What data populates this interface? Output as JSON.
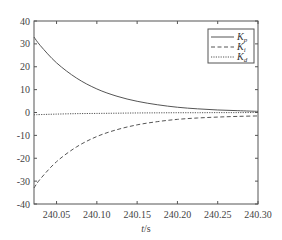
{
  "chart_data": {
    "type": "line",
    "title": "",
    "xlabel": "t/s",
    "ylabel": "",
    "xlim": [
      240.022,
      240.3
    ],
    "ylim": [
      -40,
      40
    ],
    "xticks": [
      240.05,
      240.1,
      240.15,
      240.2,
      240.25,
      240.3
    ],
    "xtick_labels": [
      "240.05",
      "240.10",
      "240.15",
      "240.20",
      "240.25",
      "240.30"
    ],
    "yticks": [
      40,
      30,
      20,
      10,
      0,
      -10,
      -20,
      -30,
      -40
    ],
    "ytick_labels": [
      "40",
      "30",
      "20",
      "10",
      "0",
      "-10",
      "-20",
      "-30",
      "-40"
    ],
    "grid": false,
    "legend_position": "upper right",
    "x": [
      240.022,
      240.03,
      240.05,
      240.075,
      240.1,
      240.125,
      240.15,
      240.175,
      240.2,
      240.225,
      240.25,
      240.275,
      240.3
    ],
    "series": [
      {
        "name": "Kp",
        "label_main": "K",
        "label_sub": "p",
        "style": "solid",
        "values": [
          33,
          29.2,
          21.7,
          15.0,
          10.3,
          7.1,
          4.9,
          3.4,
          2.3,
          1.6,
          1.1,
          0.8,
          0.5
        ]
      },
      {
        "name": "Ki",
        "label_main": "K",
        "label_sub": "i",
        "style": "dashed",
        "values": [
          -33,
          -29,
          -21.5,
          -15,
          -10.5,
          -7.5,
          -5.4,
          -4.0,
          -3.0,
          -2.4,
          -2.0,
          -1.7,
          -1.5
        ]
      },
      {
        "name": "Kd",
        "label_main": "K",
        "label_sub": "d",
        "style": "dotted",
        "values": [
          -1.0,
          -0.9,
          -0.7,
          -0.5,
          -0.4,
          -0.3,
          -0.2,
          -0.15,
          -0.1,
          -0.1,
          -0.05,
          -0.05,
          0
        ]
      }
    ]
  },
  "colors": {
    "axis": "#555555",
    "line": "#555555",
    "background": "#ffffff"
  }
}
